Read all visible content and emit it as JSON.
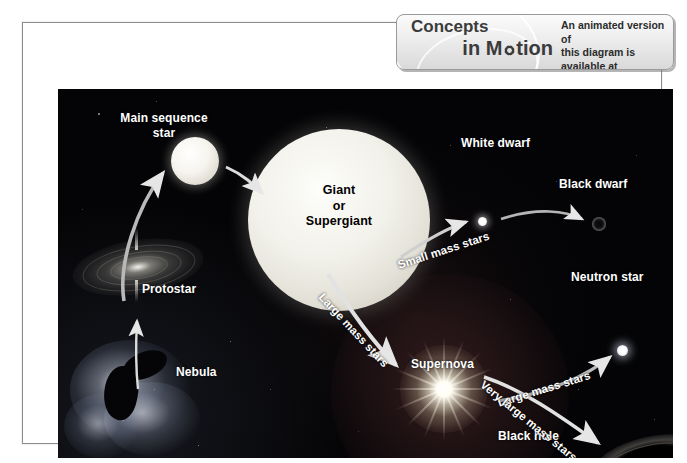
{
  "banner": {
    "logo_line1": "Concepts",
    "logo_line2_pre": "in M",
    "logo_line2_post": "tion",
    "gear_icon": "gear-icon",
    "callout_line1": "An animated version of",
    "callout_line2": "this diagram is available at",
    "callout_url": "fl6.msscience.com"
  },
  "diagram": {
    "type": "flow-diagram",
    "stages": [
      {
        "id": "nebula",
        "label": "Nebula",
        "x": 155,
        "y": 345
      },
      {
        "id": "protostar",
        "label": "Protostar",
        "x": 84,
        "y": 265
      },
      {
        "id": "main-sequence",
        "label": "Main sequence\nstar",
        "x": 105,
        "y": 96
      },
      {
        "id": "giant",
        "label": "Giant\nor\nSupergiant",
        "x": 281,
        "y": 131
      },
      {
        "id": "white-dwarf",
        "label": "White dwarf",
        "x": 475,
        "y": 118
      },
      {
        "id": "black-dwarf",
        "label": "Black dwarf",
        "x": 572,
        "y": 159
      },
      {
        "id": "supernova",
        "label": "Supernova",
        "x": 404,
        "y": 343
      },
      {
        "id": "neutron-star",
        "label": "Neutron star",
        "x": 584,
        "y": 255
      },
      {
        "id": "black-hole",
        "label": "Black hole",
        "x": 512,
        "y": 420
      }
    ],
    "paths": [
      {
        "id": "small-mass",
        "label": "Small mass stars",
        "from": "giant",
        "to": "white-dwarf"
      },
      {
        "id": "large-mass-1",
        "label": "Large mass stars",
        "from": "giant",
        "to": "supernova"
      },
      {
        "id": "large-mass-2",
        "label": "Large mass stars",
        "from": "supernova",
        "to": "neutron-star"
      },
      {
        "id": "very-large-mass",
        "label": "Very large mass stars",
        "from": "supernova",
        "to": "black-hole"
      }
    ]
  },
  "labels": {
    "main_sequence_l1": "Main sequence",
    "main_sequence_l2": "star",
    "giant_l1": "Giant",
    "giant_l2": "or",
    "giant_l3": "Supergiant",
    "protostar": "Protostar",
    "nebula": "Nebula",
    "white_dwarf": "White dwarf",
    "black_dwarf": "Black dwarf",
    "supernova": "Supernova",
    "neutron_star": "Neutron star",
    "black_hole": "Black hole",
    "small_mass_stars": "Small mass stars",
    "large_mass_stars_1": "Large mass stars",
    "large_mass_stars_2": "Large mass stars",
    "very_large_mass_stars": "Very large mass stars"
  },
  "colors": {
    "background": "#ffffff",
    "sky": "#040406",
    "frame_border": "#8d8d8d",
    "label_text": "#ffffff",
    "giant_label_text": "#000000",
    "banner_bg": "#e9e9e9",
    "banner_text": "#3b3b3b"
  }
}
